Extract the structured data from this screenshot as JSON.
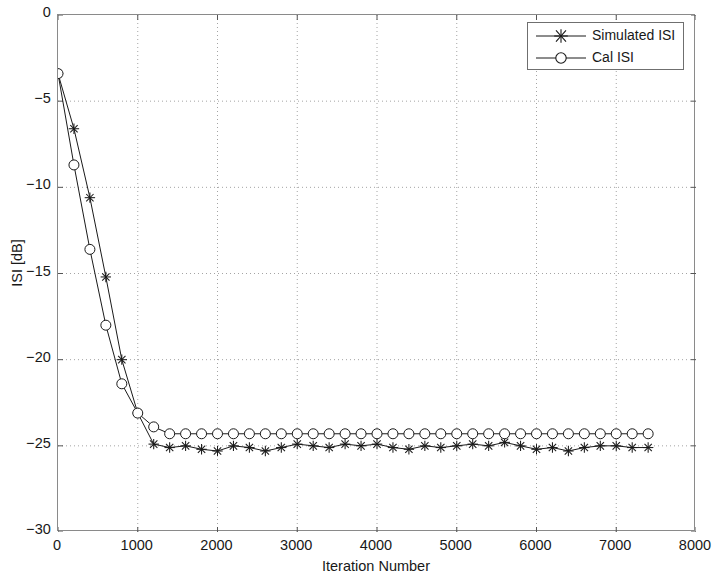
{
  "chart_data": {
    "type": "line",
    "title": "",
    "subtitle": "",
    "xlabel": "Iteration Number",
    "ylabel": "ISI [dB]",
    "xlim": [
      0,
      8000
    ],
    "ylim": [
      -30,
      0
    ],
    "xticks": [
      "0",
      "1000",
      "2000",
      "3000",
      "4000",
      "5000",
      "6000",
      "7000",
      "8000"
    ],
    "xtick_values": [
      0,
      1000,
      2000,
      3000,
      4000,
      5000,
      6000,
      7000,
      8000
    ],
    "yticks": [
      "0",
      "-5",
      "-10",
      "-15",
      "-20",
      "-25",
      "-30"
    ],
    "ytick_values": [
      0,
      -5,
      -10,
      -15,
      -20,
      -25,
      -30
    ],
    "grid": true,
    "grid_style": "dotted",
    "legend_position": "top-right",
    "legend": [
      "Simulated ISI",
      "Cal ISI"
    ],
    "marker_interval": 200,
    "series": [
      {
        "name": "Simulated ISI",
        "marker": "star",
        "color": "#1a1a1a",
        "x": [
          0,
          200,
          400,
          600,
          800,
          1000,
          1200,
          1400,
          1600,
          1800,
          2000,
          2200,
          2400,
          2600,
          2800,
          3000,
          3200,
          3400,
          3600,
          3800,
          4000,
          4200,
          4400,
          4600,
          4800,
          5000,
          5200,
          5400,
          5600,
          5800,
          6000,
          6200,
          6400,
          6600,
          6800,
          7000,
          7200,
          7400
        ],
        "values": [
          -3.4,
          -6.6,
          -10.6,
          -15.2,
          -20.0,
          -23.1,
          -24.9,
          -25.1,
          -25.0,
          -25.2,
          -25.3,
          -25.0,
          -25.1,
          -25.3,
          -25.1,
          -24.9,
          -25.0,
          -25.1,
          -24.9,
          -25.0,
          -24.9,
          -25.1,
          -25.2,
          -25.0,
          -25.1,
          -25.0,
          -24.9,
          -25.0,
          -24.8,
          -25.0,
          -25.2,
          -25.1,
          -25.3,
          -25.1,
          -25.0,
          -25.0,
          -25.1,
          -25.1
        ]
      },
      {
        "name": "Cal ISI",
        "marker": "circle",
        "color": "#1a1a1a",
        "x": [
          0,
          200,
          400,
          600,
          800,
          1000,
          1200,
          1400,
          1600,
          1800,
          2000,
          2200,
          2400,
          2600,
          2800,
          3000,
          3200,
          3400,
          3600,
          3800,
          4000,
          4200,
          4400,
          4600,
          4800,
          5000,
          5200,
          5400,
          5600,
          5800,
          6000,
          6200,
          6400,
          6600,
          6800,
          7000,
          7200,
          7400
        ],
        "values": [
          -3.4,
          -8.7,
          -13.6,
          -18.0,
          -21.4,
          -23.1,
          -23.9,
          -24.3,
          -24.3,
          -24.3,
          -24.3,
          -24.3,
          -24.3,
          -24.3,
          -24.3,
          -24.3,
          -24.3,
          -24.3,
          -24.3,
          -24.3,
          -24.3,
          -24.3,
          -24.3,
          -24.3,
          -24.3,
          -24.3,
          -24.3,
          -24.3,
          -24.3,
          -24.3,
          -24.3,
          -24.3,
          -24.3,
          -24.3,
          -24.3,
          -24.3,
          -24.3,
          -24.3
        ]
      }
    ]
  }
}
